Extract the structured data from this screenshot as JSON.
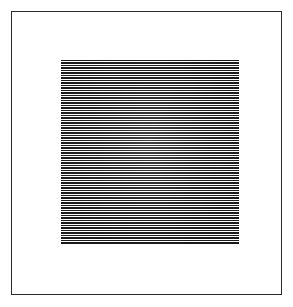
{
  "artwork": {
    "title": "Horizontal Line Square",
    "medium": "ink drawing on white paper",
    "caption": "",
    "canvas": {
      "width_px": 293,
      "height_px": 307,
      "background_color": "#ffffff"
    },
    "frame": {
      "name": "border-rectangle",
      "stroke_color": "#2b2b2b",
      "stroke_width_px": 1,
      "left_px": 11,
      "top_px": 11,
      "width_px": 271,
      "height_px": 284,
      "fill_color": "#ffffff"
    },
    "pattern": {
      "name": "horizontal-stripe-square",
      "type": "repeating horizontal lines",
      "left_px": 60,
      "top_px": 59,
      "width_px": 178,
      "height_px": 184,
      "line_color": "#1a1a1a",
      "gap_color": "#ffffff",
      "line_thickness_px": 1,
      "line_period_px": 2.5,
      "line_count": 74,
      "orientation": "horizontal",
      "spacing": "uniform"
    }
  },
  "chart_data": {
    "type": "area",
    "xlabel": "",
    "ylabel": "",
    "categories": [
      "stripe-square"
    ],
    "values": [
      74
    ]
  }
}
